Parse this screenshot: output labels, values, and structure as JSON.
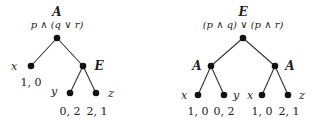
{
  "left_tree": {
    "root": {
      "player": "A",
      "formula": "p ∧ (q ∨ r)"
    },
    "nodes": {
      "x": {
        "label": "x",
        "payoff": "1, 0"
      },
      "E": {
        "label": "E"
      },
      "y": {
        "label": "y",
        "payoff": "0, 2"
      },
      "z": {
        "label": "z",
        "payoff": "2, 1"
      }
    }
  },
  "right_tree": {
    "root": {
      "player": "E",
      "formula": "(p ∧ q) ∨ (p ∧ r)"
    },
    "left_child": {
      "label": "A"
    },
    "right_child": {
      "label": "A"
    },
    "leaves": [
      {
        "label": "x",
        "payoff": "1, 0"
      },
      {
        "label": "y",
        "payoff": "0, 2"
      },
      {
        "label": "x",
        "payoff": "1, 0"
      },
      {
        "label": "z",
        "payoff": "2, 1"
      }
    ]
  },
  "colors": {
    "node": "#111111",
    "edge": "#333333"
  }
}
